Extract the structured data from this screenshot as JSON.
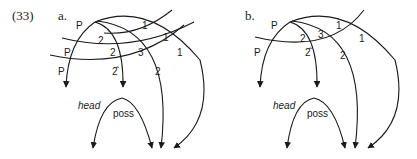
{
  "example_number": "(33)",
  "panels": [
    {
      "id": "a",
      "label": "a.",
      "arc_labels": {
        "p_top": "P",
        "p_mid": "P",
        "p_low": "P",
        "two_upper": "2",
        "two_mid": "2",
        "two_hat": "2̂",
        "one_top": "1",
        "one_mid": "1",
        "one_right": "1",
        "three": "3",
        "two_right": "2"
      },
      "head_label": "head",
      "poss_label": "poss"
    },
    {
      "id": "b",
      "label": "b.",
      "arc_labels": {
        "p_top": "P",
        "p_low": "P",
        "two_upper": "2",
        "two_hat": "2̂",
        "one_top": "1",
        "one_right": "1",
        "three": "3",
        "two_right": "2"
      },
      "head_label": "head",
      "poss_label": "poss"
    }
  ]
}
